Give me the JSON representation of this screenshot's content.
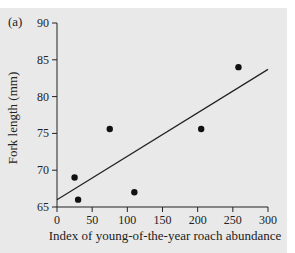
{
  "chart_data": {
    "type": "scatter",
    "panel_label": "(a)",
    "title": "",
    "xlabel": "Index of young-of-the-year roach abundance",
    "ylabel": "Fork length (mm)",
    "xlim": [
      0,
      300
    ],
    "ylim": [
      65,
      90
    ],
    "xticks": [
      0,
      50,
      100,
      150,
      200,
      250,
      300
    ],
    "yticks": [
      65,
      70,
      75,
      80,
      85,
      90
    ],
    "grid": false,
    "legend": null,
    "series": [
      {
        "name": "observations",
        "points": [
          {
            "x": 25,
            "y": 69.0
          },
          {
            "x": 30,
            "y": 66.0
          },
          {
            "x": 75,
            "y": 75.6
          },
          {
            "x": 110,
            "y": 67.0
          },
          {
            "x": 205,
            "y": 75.6
          },
          {
            "x": 258,
            "y": 84.0
          }
        ]
      }
    ],
    "fit_line": {
      "x0": 0,
      "y0": 66.0,
      "x1": 300,
      "y1": 83.7
    },
    "colors": {
      "background": "#e9e9e9",
      "ink": "#222222"
    }
  }
}
